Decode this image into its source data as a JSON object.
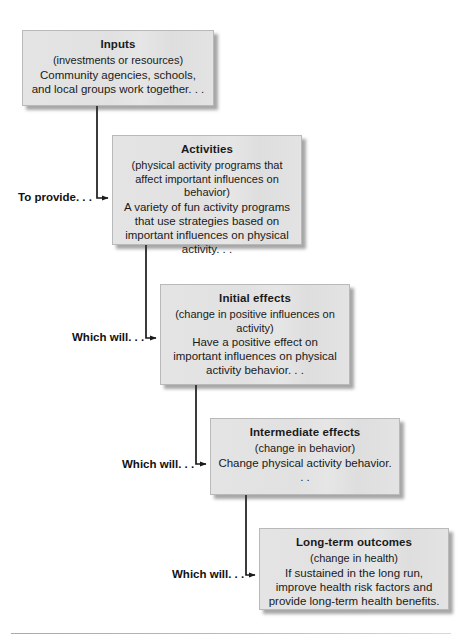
{
  "diagram": {
    "type": "flowchart",
    "box_fill_color": "#e2e2e2",
    "box_border_color": "#b9b9b9",
    "line_color": "#1a1a1a",
    "nodes": [
      {
        "id": "inputs",
        "title": "Inputs",
        "paren": "(investments or resources)",
        "body": "Community agencies, schools, and local groups work together. . ."
      },
      {
        "id": "activities",
        "title": "Activities",
        "paren": "(physical activity programs that affect important influences on behavior)",
        "body": "A variety of fun activity programs that use strategies based on important influences on physical activity. . ."
      },
      {
        "id": "initial-effects",
        "title": "Initial effects",
        "paren": "(change in positive influences on activity)",
        "body": "Have a positive effect on important influences on physical activity behavior. . ."
      },
      {
        "id": "intermediate-effects",
        "title": "Intermediate effects",
        "paren": "(change in behavior)",
        "body": "Change physical activity behavior. . ."
      },
      {
        "id": "long-term-outcomes",
        "title": "Long-term outcomes",
        "paren": "(change in health)",
        "body": "If sustained in the long run, improve health risk factors and provide long-term health benefits."
      }
    ],
    "edges": [
      {
        "from": "inputs",
        "to": "activities",
        "label": "To provide. . ."
      },
      {
        "from": "activities",
        "to": "initial-effects",
        "label": "Which will. . ."
      },
      {
        "from": "initial-effects",
        "to": "intermediate-effects",
        "label": "Which will. . ."
      },
      {
        "from": "intermediate-effects",
        "to": "long-term-outcomes",
        "label": "Which will. . ."
      }
    ]
  }
}
